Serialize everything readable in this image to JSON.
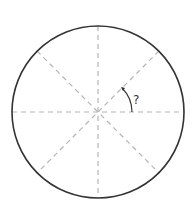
{
  "diagram": {
    "circle": {
      "cx": 98,
      "cy": 112,
      "r": 86,
      "stroke": "#333333"
    },
    "divider_lines": {
      "count": 4,
      "style": "dashed",
      "color": "#b0b0b0"
    },
    "angle_label": "?",
    "angle_marker_color": "#333333"
  }
}
